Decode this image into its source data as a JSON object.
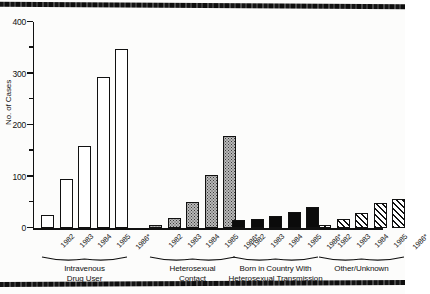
{
  "chart_data": {
    "type": "bar",
    "title": "",
    "xlabel": "",
    "ylabel": "No. of Cases",
    "ylim": [
      0,
      400
    ],
    "ytick_labels": [
      "0",
      "100",
      "200",
      "300",
      "400"
    ],
    "ytick_values": [
      0,
      100,
      200,
      300,
      400
    ],
    "yminor_values": [
      50,
      150,
      250,
      350
    ],
    "grid": false,
    "legend": "none",
    "categories": [
      "1982",
      "1983",
      "1984",
      "1985",
      "1986*"
    ],
    "footnote_marker": "*",
    "groups": [
      {
        "name": "Intravenous Drug User",
        "caption_lines": [
          "Intravenous",
          "Drug User"
        ],
        "fill": "open",
        "values": [
          25,
          95,
          160,
          293,
          348
        ]
      },
      {
        "name": "Heterosexual Contact",
        "caption_lines": [
          "Heterosexual",
          "Contact"
        ],
        "fill": "stipple",
        "values": [
          5,
          20,
          50,
          103,
          178
        ]
      },
      {
        "name": "Born in Country With Heterosexual Transmission",
        "caption_lines": [
          "Born in Country With",
          "Heterosexual Transmission"
        ],
        "fill": "solid",
        "values": [
          15,
          18,
          24,
          31,
          40
        ]
      },
      {
        "name": "Other/Unknown",
        "caption_lines": [
          "Other/Unknown"
        ],
        "fill": "hatch",
        "values": [
          5,
          18,
          30,
          48,
          57
        ]
      }
    ]
  }
}
